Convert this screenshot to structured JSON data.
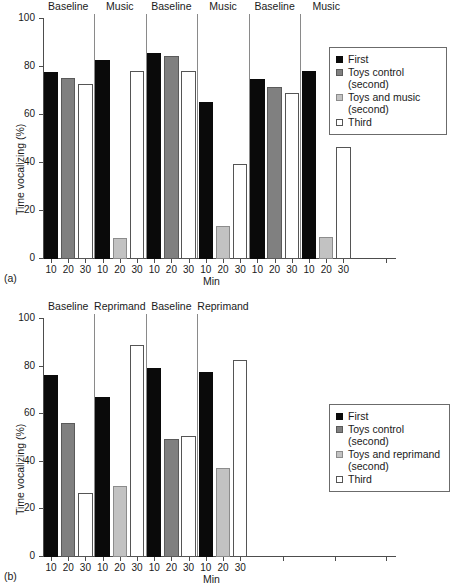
{
  "chart_data": [
    {
      "panel": "(a)",
      "type": "bar",
      "title": "",
      "xlabel": "Min",
      "ylabel": "Time vocalizing (%)",
      "ylim": [
        0,
        100
      ],
      "yticks": [
        0,
        20,
        40,
        60,
        80,
        100
      ],
      "grid": false,
      "legend_position": "right",
      "phases": [
        "Baseline",
        "Music",
        "Baseline",
        "Music",
        "Baseline",
        "Music"
      ],
      "categories": [
        "10",
        "20",
        "30",
        "10",
        "20",
        "30",
        "10",
        "20",
        "30",
        "10",
        "20",
        "30",
        "10",
        "20",
        "30",
        "10",
        "20",
        "30"
      ],
      "legend": [
        "First",
        "Toys control\n(second)",
        "Toys and music\n(second)",
        "Third"
      ],
      "bars": [
        {
          "phase": "Baseline",
          "min": "10",
          "series": "First",
          "value": 77.5
        },
        {
          "phase": "Baseline",
          "min": "20",
          "series": "Toys control (second)",
          "value": 75.2
        },
        {
          "phase": "Baseline",
          "min": "30",
          "series": "Third",
          "value": 72.7
        },
        {
          "phase": "Music",
          "min": "10",
          "series": "First",
          "value": 82.5
        },
        {
          "phase": "Music",
          "min": "20",
          "series": "Toys and music (second)",
          "value": 8.3
        },
        {
          "phase": "Music",
          "min": "30",
          "series": "Third",
          "value": 77.9
        },
        {
          "phase": "Baseline",
          "min": "10",
          "series": "First",
          "value": 85.4
        },
        {
          "phase": "Baseline",
          "min": "20",
          "series": "Toys control (second)",
          "value": 84.0
        },
        {
          "phase": "Baseline",
          "min": "30",
          "series": "Third",
          "value": 77.8
        },
        {
          "phase": "Music",
          "min": "10",
          "series": "First",
          "value": 65.1
        },
        {
          "phase": "Music",
          "min": "20",
          "series": "Toys and music (second)",
          "value": 13.4
        },
        {
          "phase": "Music",
          "min": "30",
          "series": "Third",
          "value": 39.3
        },
        {
          "phase": "Baseline",
          "min": "10",
          "series": "First",
          "value": 74.5
        },
        {
          "phase": "Baseline",
          "min": "20",
          "series": "Toys control (second)",
          "value": 71.2
        },
        {
          "phase": "Baseline",
          "min": "30",
          "series": "Third",
          "value": 68.8
        },
        {
          "phase": "Music",
          "min": "10",
          "series": "First",
          "value": 77.8
        },
        {
          "phase": "Music",
          "min": "20",
          "series": "Toys and music (second)",
          "value": 8.8
        },
        {
          "phase": "Music",
          "min": "30",
          "series": "Third",
          "value": 46.4
        }
      ]
    },
    {
      "panel": "(b)",
      "type": "bar",
      "title": "",
      "xlabel": "Min",
      "ylabel": "Time vocalizing (%)",
      "ylim": [
        0,
        100
      ],
      "yticks": [
        0,
        20,
        40,
        60,
        80,
        100
      ],
      "grid": false,
      "legend_position": "right",
      "phases": [
        "Baseline",
        "Reprimand",
        "Baseline",
        "Reprimand"
      ],
      "categories": [
        "10",
        "20",
        "30",
        "10",
        "20",
        "30",
        "10",
        "20",
        "30",
        "10",
        "20",
        "30"
      ],
      "legend": [
        "First",
        "Toys control\n(second)",
        "Toys and reprimand\n(second)",
        "Third"
      ],
      "bars": [
        {
          "phase": "Baseline",
          "min": "10",
          "series": "First",
          "value": 76.0
        },
        {
          "phase": "Baseline",
          "min": "20",
          "series": "Toys control (second)",
          "value": 55.8
        },
        {
          "phase": "Baseline",
          "min": "30",
          "series": "Third",
          "value": 26.5
        },
        {
          "phase": "Reprimand",
          "min": "10",
          "series": "First",
          "value": 66.9
        },
        {
          "phase": "Reprimand",
          "min": "20",
          "series": "Toys and reprimand (second)",
          "value": 29.6
        },
        {
          "phase": "Reprimand",
          "min": "30",
          "series": "Third",
          "value": 88.8
        },
        {
          "phase": "Baseline",
          "min": "10",
          "series": "First",
          "value": 78.9
        },
        {
          "phase": "Baseline",
          "min": "20",
          "series": "Toys control (second)",
          "value": 49.0
        },
        {
          "phase": "Baseline",
          "min": "30",
          "series": "Third",
          "value": 50.3
        },
        {
          "phase": "Reprimand",
          "min": "10",
          "series": "First",
          "value": 77.2
        },
        {
          "phase": "Reprimand",
          "min": "20",
          "series": "Toys and reprimand (second)",
          "value": 37.1
        },
        {
          "phase": "Reprimand",
          "min": "30",
          "series": "Third",
          "value": 82.5
        }
      ]
    }
  ],
  "panel_a": {
    "tag": "(a)",
    "ytitle": "Time vocalizing (%)",
    "xtitle": "Min",
    "yticks": [
      "100",
      "80",
      "60",
      "40",
      "20",
      "0"
    ],
    "xticks": [
      "10",
      "20",
      "30",
      "10",
      "20",
      "30",
      "10",
      "20",
      "30",
      "10",
      "20",
      "30",
      "10",
      "20",
      "30",
      "10",
      "20",
      "30"
    ],
    "phases": [
      "Baseline",
      "Music",
      "Baseline",
      "Music",
      "Baseline",
      "Music"
    ],
    "legend": [
      {
        "label": "First",
        "style": "first"
      },
      {
        "label": "Toys control\n(second)",
        "style": "toysctl"
      },
      {
        "label": "Toys and music\n(second)",
        "style": "toysmus"
      },
      {
        "label": "Third",
        "style": "third"
      }
    ],
    "values": [
      77.5,
      75.2,
      72.7,
      82.5,
      8.3,
      77.9,
      85.4,
      84.0,
      77.8,
      65.1,
      13.4,
      39.3,
      74.5,
      71.2,
      68.8,
      77.8,
      8.8,
      46.4
    ],
    "styles": [
      "first",
      "toysctl",
      "third",
      "first",
      "toysmus",
      "third",
      "first",
      "toysctl",
      "third",
      "first",
      "toysmus",
      "third",
      "first",
      "toysctl",
      "third",
      "first",
      "toysmus",
      "third"
    ]
  },
  "panel_b": {
    "tag": "(b)",
    "ytitle": "Time vocalizing (%)",
    "xtitle": "Min",
    "yticks": [
      "100",
      "80",
      "60",
      "40",
      "20",
      "0"
    ],
    "xticks": [
      "10",
      "20",
      "30",
      "10",
      "20",
      "30",
      "10",
      "20",
      "30",
      "10",
      "20",
      "30"
    ],
    "phases": [
      "Baseline",
      "Reprimand",
      "Baseline",
      "Reprimand"
    ],
    "legend": [
      {
        "label": "First",
        "style": "first"
      },
      {
        "label": "Toys control\n(second)",
        "style": "toysctl"
      },
      {
        "label": "Toys and reprimand\n(second)",
        "style": "toysmus"
      },
      {
        "label": "Third",
        "style": "third"
      }
    ],
    "values": [
      76.0,
      55.8,
      26.5,
      66.9,
      29.6,
      88.8,
      78.9,
      49.0,
      50.3,
      77.2,
      37.1,
      82.5
    ],
    "styles": [
      "first",
      "toysctl",
      "third",
      "first",
      "toysmus",
      "third",
      "first",
      "toysctl",
      "third",
      "first",
      "toysmus",
      "third"
    ]
  }
}
